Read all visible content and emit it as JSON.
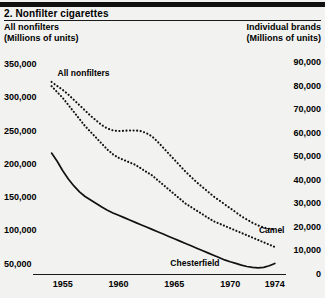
{
  "figure": {
    "number_title": "2.  Nonfilter cigarettes"
  },
  "axes_headings": {
    "left_title": "All nonfilters",
    "left_units": "(Millions of units)",
    "right_title": "Individual brands",
    "right_units": "(Millions of units)"
  },
  "chart_data": {
    "type": "line",
    "title": "2.  Nonfilter cigarettes",
    "xlabel": "",
    "ylabel": "All nonfilters (Millions of units)",
    "y2label": "Individual brands (Millions of units)",
    "grid": false,
    "legend": "inline-annotations",
    "xlim": [
      1953.5,
      1975.0
    ],
    "ylim": [
      35000,
      360000
    ],
    "y2lim": [
      0,
      92000
    ],
    "left_tick_labels": [
      "350,000",
      "300,000",
      "250,000",
      "200,000",
      "150,000",
      "100,000",
      "50,000"
    ],
    "left_tick_values": [
      350000,
      300000,
      250000,
      200000,
      150000,
      100000,
      50000
    ],
    "right_tick_labels": [
      "90,000",
      "80,000",
      "70,000",
      "60,000",
      "50,000",
      "40,000",
      "30,000",
      "20,000",
      "10,000",
      "0"
    ],
    "right_tick_values": [
      90000,
      80000,
      70000,
      60000,
      50000,
      40000,
      30000,
      20000,
      10000,
      0
    ],
    "x_tick_labels": [
      "1955",
      "1960",
      "1965",
      "1970",
      "1974"
    ],
    "x_tick_values": [
      1955,
      1960,
      1965,
      1970,
      1974
    ],
    "series": [
      {
        "name": "All nonfilters",
        "axis": "left",
        "style": "dotted",
        "label_text": "All nonfilters",
        "x": [
          1954.0,
          1954.5,
          1955.0,
          1955.5,
          1956.0,
          1956.5,
          1957.0,
          1957.5,
          1958.0,
          1958.5,
          1959.0,
          1959.5,
          1960.0,
          1960.5,
          1961.0,
          1961.5,
          1962.0,
          1962.5,
          1963.0,
          1963.5,
          1964.0,
          1964.5,
          1965.0,
          1965.5,
          1966.0,
          1966.5,
          1967.0,
          1967.5,
          1968.0,
          1968.5,
          1969.0,
          1969.5,
          1970.0,
          1970.5,
          1971.0,
          1971.5,
          1972.0,
          1972.5,
          1973.0,
          1973.5,
          1974.0
        ],
        "values": [
          324000,
          318000,
          312000,
          305000,
          297000,
          289000,
          281000,
          273000,
          266000,
          259000,
          254000,
          251000,
          250000,
          250500,
          251000,
          251000,
          250000,
          247000,
          242000,
          234000,
          225000,
          216000,
          207000,
          198000,
          189000,
          181000,
          173000,
          166000,
          159000,
          152000,
          146000,
          140000,
          134000,
          128000,
          122000,
          117000,
          112000,
          108000,
          105000,
          103000,
          102000
        ]
      },
      {
        "name": "Camel",
        "axis": "right",
        "style": "dotted",
        "label_text": "Camel",
        "x": [
          1954.0,
          1954.5,
          1955.0,
          1955.5,
          1956.0,
          1956.5,
          1957.0,
          1957.5,
          1958.0,
          1958.5,
          1959.0,
          1959.5,
          1960.0,
          1960.5,
          1961.0,
          1961.5,
          1962.0,
          1962.5,
          1963.0,
          1963.5,
          1964.0,
          1964.5,
          1965.0,
          1965.5,
          1966.0,
          1966.5,
          1967.0,
          1967.5,
          1968.0,
          1968.5,
          1969.0,
          1969.5,
          1970.0,
          1970.5,
          1971.0,
          1971.5,
          1972.0,
          1972.5,
          1973.0,
          1973.5,
          1974.0
        ],
        "values": [
          80000,
          77500,
          75000,
          72000,
          69000,
          66000,
          63000,
          60500,
          58000,
          55500,
          53000,
          51000,
          49500,
          48500,
          47500,
          46500,
          45000,
          43500,
          42000,
          40000,
          38000,
          36000,
          34000,
          32000,
          30000,
          28500,
          27000,
          25500,
          24000,
          22500,
          21500,
          20500,
          19500,
          18500,
          17500,
          16500,
          15500,
          14500,
          13500,
          12500,
          11500
        ]
      },
      {
        "name": "Chesterfield",
        "axis": "right",
        "style": "solid",
        "label_text": "Chesterfield",
        "x": [
          1954.0,
          1954.5,
          1955.0,
          1955.5,
          1956.0,
          1956.5,
          1957.0,
          1957.5,
          1958.0,
          1958.5,
          1959.0,
          1959.5,
          1960.0,
          1960.5,
          1961.0,
          1961.5,
          1962.0,
          1962.5,
          1963.0,
          1963.5,
          1964.0,
          1964.5,
          1965.0,
          1965.5,
          1966.0,
          1966.5,
          1967.0,
          1967.5,
          1968.0,
          1968.5,
          1969.0,
          1969.5,
          1970.0,
          1970.5,
          1971.0,
          1971.5,
          1972.0,
          1972.5,
          1973.0,
          1973.5,
          1974.0
        ],
        "values": [
          51500,
          48000,
          44000,
          40500,
          37500,
          35000,
          33000,
          31500,
          30000,
          28500,
          27200,
          26000,
          25000,
          24000,
          23000,
          22000,
          21000,
          20000,
          19000,
          18000,
          17000,
          16000,
          15000,
          14000,
          13000,
          12000,
          11000,
          10000,
          9000,
          8000,
          7000,
          6000,
          5200,
          4500,
          3800,
          3200,
          2800,
          2600,
          2800,
          3500,
          4500
        ]
      }
    ]
  }
}
